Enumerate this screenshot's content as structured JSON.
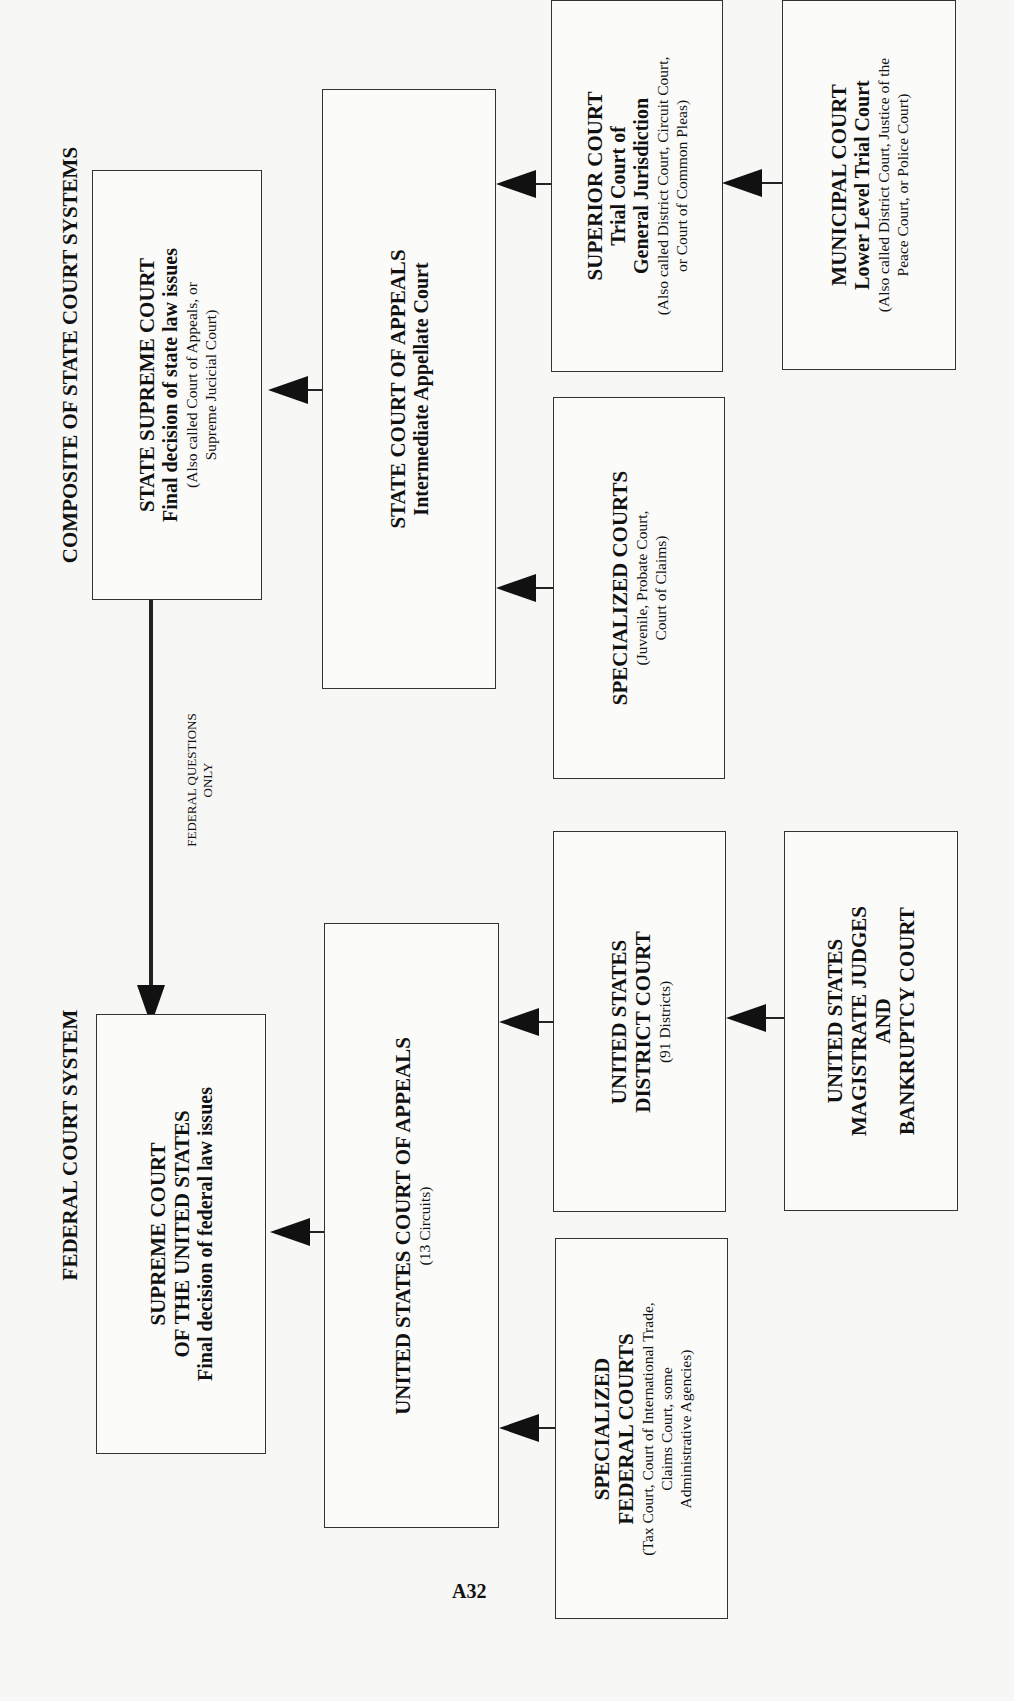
{
  "headings": {
    "state": "COMPOSITE OF STATE COURT SYSTEMS",
    "federal": "FEDERAL COURT SYSTEM"
  },
  "connector_label": [
    "FEDERAL QUESTIONS",
    "ONLY"
  ],
  "page_number": "A32",
  "state_courts": {
    "supreme": {
      "title": "STATE SUPREME COURT",
      "subtitle": "Final decision of state law issues",
      "note": [
        "(Also called Court of Appeals, or",
        "Supreme Jucicial Court)"
      ]
    },
    "appeals": {
      "title": "STATE COURT OF APPEALS",
      "subtitle": "Intermediate Appellate Court"
    },
    "superior": {
      "title": "SUPERIOR COURT",
      "subtitle": [
        "Trial Court of",
        "General Jurisdiction"
      ],
      "note": [
        "(Also called District Court, Circuit Court,",
        "or Court of Common Pleas)"
      ]
    },
    "specialized": {
      "title": "SPECIALIZED COURTS",
      "note": [
        "(Juvenile, Probate Court,",
        "Court of Claims)"
      ]
    },
    "municipal": {
      "title": "MUNICIPAL COURT",
      "subtitle": "Lower Level Trial Court",
      "note": [
        "(Also called District Court, Justice of the",
        "Peace Court, or Police Court)"
      ]
    }
  },
  "federal_courts": {
    "supreme": {
      "title": [
        "SUPREME COURT",
        "OF THE UNITED STATES"
      ],
      "subtitle": "Final decision of federal law issues"
    },
    "appeals": {
      "title": "UNITED STATES COURT OF APPEALS",
      "note": "(13 Circuits)"
    },
    "district": {
      "title": [
        "UNITED STATES",
        "DISTRICT COURT"
      ],
      "note": "(91 Districts)"
    },
    "magistrate": {
      "title": [
        "UNITED STATES",
        "MAGISTRATE JUDGES",
        "AND",
        "BANKRUPTCY COURT"
      ]
    },
    "specialized": {
      "title": [
        "SPECIALIZED",
        "FEDERAL COURTS"
      ],
      "note": [
        "(Tax Court, Court of International Trade,",
        "Claims Court, some",
        "Administrative Agencies)"
      ]
    }
  }
}
